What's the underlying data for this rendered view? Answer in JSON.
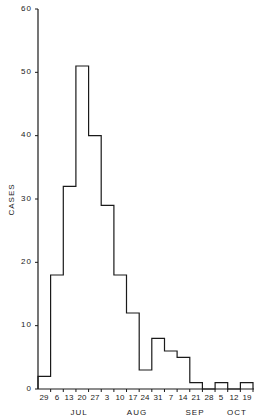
{
  "chart_data": {
    "type": "bar",
    "subtype": "histogram (step outline)",
    "title": "",
    "xlabel": "",
    "ylabel": "CASES",
    "ylim": [
      0,
      60
    ],
    "yticks": [
      0,
      10,
      20,
      30,
      40,
      50,
      60
    ],
    "grid": false,
    "legend": null,
    "categories": [
      "29",
      "6",
      "13",
      "20",
      "27",
      "3",
      "10",
      "17",
      "24",
      "31",
      "7",
      "14",
      "21",
      "28",
      "5",
      "12",
      "19"
    ],
    "week_start_month": [
      "JUN",
      "JUL",
      "JUL",
      "JUL",
      "JUL",
      "AUG",
      "AUG",
      "AUG",
      "AUG",
      "AUG",
      "SEP",
      "SEP",
      "SEP",
      "SEP",
      "OCT",
      "OCT",
      "OCT"
    ],
    "values": [
      2,
      18,
      32,
      51,
      40,
      29,
      18,
      12,
      3,
      8,
      6,
      5,
      1,
      0,
      1,
      0,
      1
    ],
    "month_labels": [
      {
        "label": "JUL",
        "center_index": 2.5
      },
      {
        "label": "AUG",
        "center_index": 7
      },
      {
        "label": "SEP",
        "center_index": 11.5
      },
      {
        "label": "OCT",
        "center_index": 15
      }
    ]
  },
  "axis": {
    "y_title": "CASES",
    "y_tick_labels": [
      "0",
      "10",
      "20",
      "30",
      "40",
      "50",
      "60"
    ],
    "x_tick_labels": [
      "29",
      "6",
      "13",
      "20",
      "27",
      "3",
      "10",
      "17",
      "24",
      "31",
      "7",
      "14",
      "21",
      "28",
      "5",
      "12",
      "19"
    ],
    "months": [
      "JUL",
      "AUG",
      "SEP",
      "OCT"
    ]
  },
  "style": {
    "line_color": "#1a1a1a",
    "background": "#ffffff"
  }
}
